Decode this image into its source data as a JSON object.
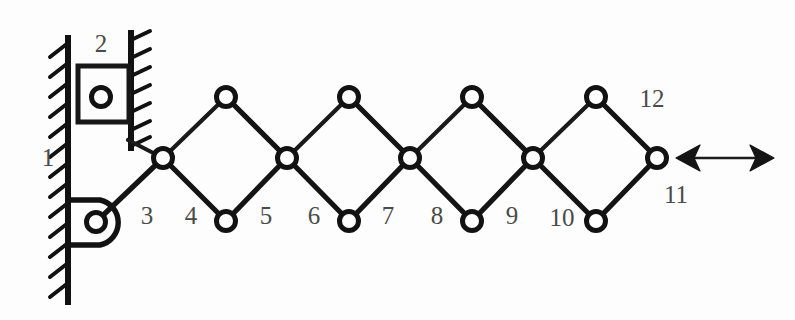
{
  "figure": {
    "background_color": "#fdfdfd",
    "line_color": "#141414",
    "label_color": "#4a4a4a",
    "joint_fill": "#ffffff"
  },
  "labels": [
    {
      "id": "label-1",
      "text": "1",
      "x": 48,
      "y": 166
    },
    {
      "id": "label-2",
      "text": "2",
      "x": 101,
      "y": 52
    },
    {
      "id": "label-3",
      "text": "3",
      "x": 147,
      "y": 224
    },
    {
      "id": "label-4",
      "text": "4",
      "x": 191,
      "y": 224
    },
    {
      "id": "label-5",
      "text": "5",
      "x": 266,
      "y": 224
    },
    {
      "id": "label-6",
      "text": "6",
      "x": 314,
      "y": 224
    },
    {
      "id": "label-7",
      "text": "7",
      "x": 388,
      "y": 224
    },
    {
      "id": "label-8",
      "text": "8",
      "x": 437,
      "y": 224
    },
    {
      "id": "label-9",
      "text": "9",
      "x": 512,
      "y": 224
    },
    {
      "id": "label-10",
      "text": "10",
      "x": 562,
      "y": 226
    },
    {
      "id": "label-11",
      "text": "11",
      "x": 676,
      "y": 203
    },
    {
      "id": "label-12",
      "text": "12",
      "x": 652,
      "y": 107
    }
  ],
  "joints": [
    {
      "id": "joint-slider-pivot",
      "x": 101,
      "y": 97,
      "r": 9.5,
      "kind": "slider-pivot"
    },
    {
      "id": "joint-ground-pivot",
      "x": 96,
      "y": 222,
      "r": 9.5,
      "kind": "fixed-pivot"
    },
    {
      "id": "joint-mid-1",
      "x": 163,
      "y": 158,
      "r": 9.5,
      "kind": "scissor-crossing"
    },
    {
      "id": "joint-mid-2",
      "x": 287,
      "y": 158,
      "r": 9.5,
      "kind": "scissor-crossing"
    },
    {
      "id": "joint-mid-3",
      "x": 410,
      "y": 158,
      "r": 9.5,
      "kind": "scissor-crossing"
    },
    {
      "id": "joint-mid-4",
      "x": 533,
      "y": 158,
      "r": 9.5,
      "kind": "scissor-crossing"
    },
    {
      "id": "joint-mid-5",
      "x": 657,
      "y": 158,
      "r": 9.5,
      "kind": "output-pivot"
    },
    {
      "id": "joint-top-1",
      "x": 226,
      "y": 97,
      "r": 9.5,
      "kind": "apex"
    },
    {
      "id": "joint-top-2",
      "x": 349,
      "y": 97,
      "r": 9.5,
      "kind": "apex"
    },
    {
      "id": "joint-top-3",
      "x": 472,
      "y": 97,
      "r": 9.5,
      "kind": "apex"
    },
    {
      "id": "joint-top-4",
      "x": 596,
      "y": 97,
      "r": 9.5,
      "kind": "apex"
    },
    {
      "id": "joint-bot-1",
      "x": 226,
      "y": 221,
      "r": 9.5,
      "kind": "apex"
    },
    {
      "id": "joint-bot-2",
      "x": 349,
      "y": 221,
      "r": 9.5,
      "kind": "apex"
    },
    {
      "id": "joint-bot-3",
      "x": 472,
      "y": 221,
      "r": 9.5,
      "kind": "apex"
    },
    {
      "id": "joint-bot-4",
      "x": 596,
      "y": 221,
      "r": 9.5,
      "kind": "apex"
    }
  ],
  "links": [
    {
      "id": "link-slider-to-mid1",
      "x1": 128,
      "y1": 140,
      "x2": 163,
      "y2": 158,
      "weight": "thin"
    },
    {
      "id": "link-ground-to-mid1",
      "x1": 96,
      "y1": 222,
      "x2": 163,
      "y2": 158,
      "weight": "thick"
    },
    {
      "id": "link-mid1-top1",
      "x1": 163,
      "y1": 158,
      "x2": 226,
      "y2": 97,
      "weight": "thin"
    },
    {
      "id": "link-top1-mid2",
      "x1": 226,
      "y1": 97,
      "x2": 287,
      "y2": 158,
      "weight": "thick"
    },
    {
      "id": "link-mid1-bot1",
      "x1": 163,
      "y1": 158,
      "x2": 226,
      "y2": 221,
      "weight": "thick"
    },
    {
      "id": "link-bot1-mid2",
      "x1": 226,
      "y1": 221,
      "x2": 287,
      "y2": 158,
      "weight": "thick"
    },
    {
      "id": "link-mid2-top2",
      "x1": 287,
      "y1": 158,
      "x2": 349,
      "y2": 97,
      "weight": "thin"
    },
    {
      "id": "link-top2-mid3",
      "x1": 349,
      "y1": 97,
      "x2": 410,
      "y2": 158,
      "weight": "thick"
    },
    {
      "id": "link-mid2-bot2",
      "x1": 287,
      "y1": 158,
      "x2": 349,
      "y2": 221,
      "weight": "thick"
    },
    {
      "id": "link-bot2-mid3",
      "x1": 349,
      "y1": 221,
      "x2": 410,
      "y2": 158,
      "weight": "thick"
    },
    {
      "id": "link-mid3-top3",
      "x1": 410,
      "y1": 158,
      "x2": 472,
      "y2": 97,
      "weight": "thin"
    },
    {
      "id": "link-top3-mid4",
      "x1": 472,
      "y1": 97,
      "x2": 533,
      "y2": 158,
      "weight": "thick"
    },
    {
      "id": "link-mid3-bot3",
      "x1": 410,
      "y1": 158,
      "x2": 472,
      "y2": 221,
      "weight": "thick"
    },
    {
      "id": "link-bot3-mid4",
      "x1": 472,
      "y1": 221,
      "x2": 533,
      "y2": 158,
      "weight": "thick"
    },
    {
      "id": "link-mid4-top4",
      "x1": 533,
      "y1": 158,
      "x2": 596,
      "y2": 97,
      "weight": "thin"
    },
    {
      "id": "link-top4-mid5",
      "x1": 596,
      "y1": 97,
      "x2": 657,
      "y2": 158,
      "weight": "thick"
    },
    {
      "id": "link-mid4-bot4",
      "x1": 533,
      "y1": 158,
      "x2": 596,
      "y2": 221,
      "weight": "thick"
    },
    {
      "id": "link-bot4-mid5",
      "x1": 596,
      "y1": 221,
      "x2": 657,
      "y2": 158,
      "weight": "thick"
    }
  ],
  "walls": [
    {
      "id": "wall-main-left",
      "x": 68,
      "y_top": 38,
      "y_bottom": 302,
      "hatch_side": "left",
      "hatch_count": 13
    },
    {
      "id": "wall-slot-right",
      "x": 131,
      "y_top": 33,
      "y_bottom": 148,
      "hatch_side": "right",
      "hatch_count": 6
    }
  ],
  "slider": {
    "id": "slider-block-2",
    "x": 78,
    "y": 66,
    "width": 51,
    "height": 56
  },
  "ground_bracket": {
    "id": "fixed-pivot-bracket",
    "x_wall": 70,
    "y_top": 200,
    "y_bottom": 245,
    "x_right": 120
  },
  "motion_arrow": {
    "id": "output-motion-arrow",
    "x_left": 678,
    "x_right": 772,
    "y": 158,
    "head_length": 21,
    "head_half_width": 13,
    "direction": "bidirectional"
  }
}
